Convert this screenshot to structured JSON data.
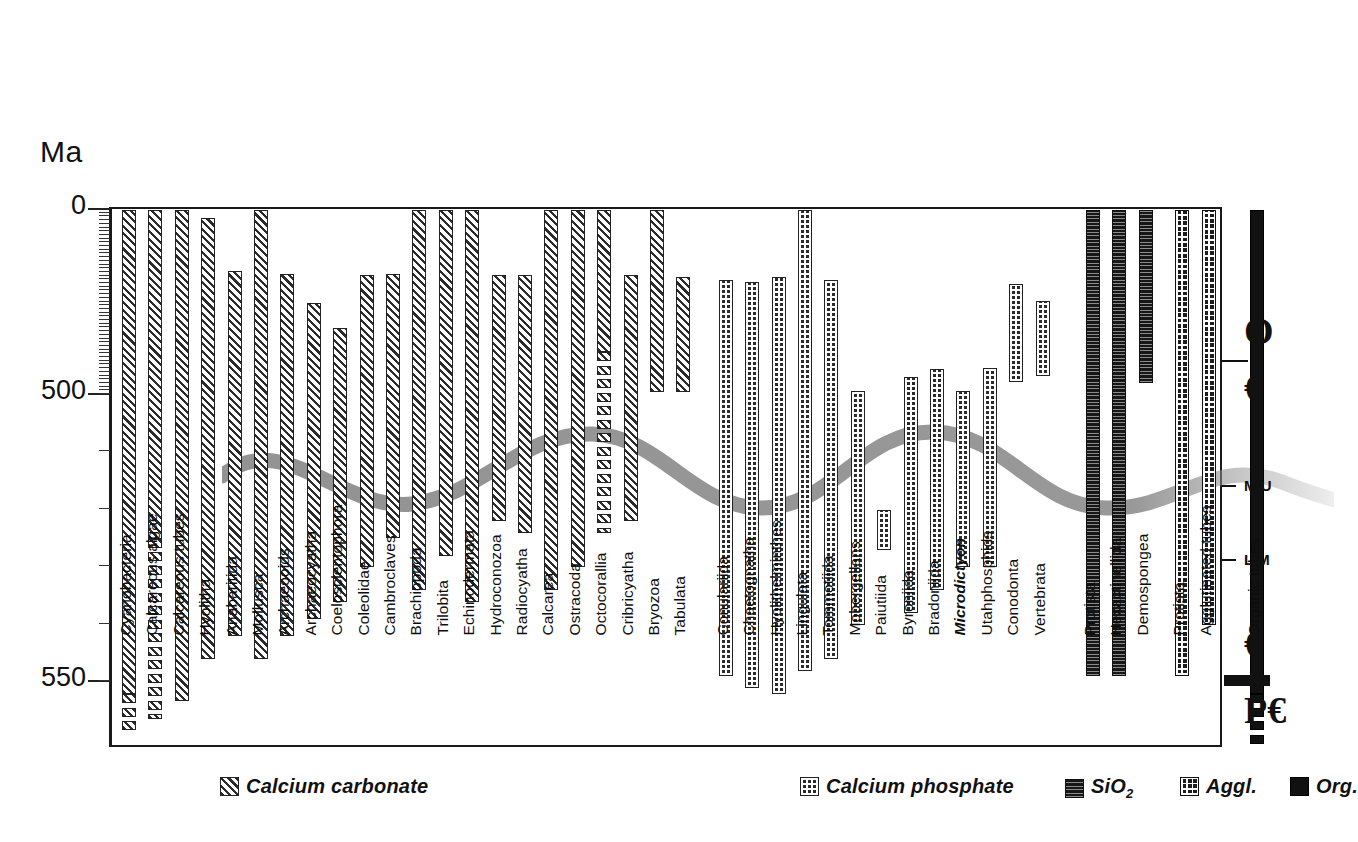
{
  "axis": {
    "unit_label": "Ma",
    "ticks": [
      {
        "label": "0",
        "value": 0
      },
      {
        "label": "500",
        "value": 500
      },
      {
        "label": "550",
        "value": 550
      }
    ]
  },
  "stratigraphy": [
    {
      "label": "O",
      "name": "ordovician"
    },
    {
      "label": "€",
      "name": "cambrian-upper"
    },
    {
      "label": "M/U",
      "name": "middle-upper-boundary"
    },
    {
      "label": "L/M",
      "name": "lower-middle-boundary"
    },
    {
      "label": "€",
      "name": "cambrian-lower"
    },
    {
      "label": "P€",
      "name": "precambrian"
    }
  ],
  "legend": [
    {
      "label": "Calcium carbonate",
      "fill": "f-carb",
      "name": "calcium-carbonate"
    },
    {
      "label": "Calcium phosphate",
      "fill": "f-phos",
      "name": "calcium-phosphate"
    },
    {
      "label": "SiO2",
      "label_html": "SiO<sub>2</sub>",
      "fill": "f-sio2",
      "name": "silica"
    },
    {
      "label": "Aggl.",
      "fill": "f-aggl",
      "name": "agglutinated"
    },
    {
      "label": "Org.",
      "fill": "f-org",
      "name": "organic"
    }
  ],
  "chart_data": {
    "type": "bar",
    "title": "",
    "orientation": "vertical-range",
    "xlabel": "",
    "ylabel": "Ma",
    "ylim": [
      0,
      560
    ],
    "y_axis_note": "Geologic time, millions of years; axis compressed above 500 Ma",
    "grid": false,
    "legend_position": "bottom",
    "categories": [
      "Cyanobacteria",
      "Calcareous algae",
      "Calcareous tubes",
      "Hyolitha",
      "Anabaritida",
      "Mollusca",
      "Archaeooids",
      "Archaeocyatha",
      "Coelosclentophora",
      "Coleolidae",
      "Cambroclaves",
      "Brachiopoda",
      "Trilobita",
      "Echinodermata",
      "Hydroconozoa",
      "Radiocyatha",
      "Calcarea",
      "Ostracoda",
      "Octocorallia",
      "Cribricyatha",
      "Bryozoa",
      "Tabulata",
      "Conulariida",
      "Chaetognatha",
      "Hyolithelminthes",
      "Lingulata",
      "Tommotiida",
      "Mobergellans",
      "Paiutiida",
      "Byroniida",
      "Bradoniida",
      "Microdictyon",
      "Utahphosphids",
      "Conodonta",
      "Vertebrata",
      "Protista",
      "Hexactinellida",
      "Demospongea",
      "Protista",
      "Agglutinated tubes",
      "Organic tubes"
    ],
    "series": [
      {
        "name": "Stratigraphic range (first appearance to top of plotted interval)",
        "unit": "Ma",
        "bars": [
          {
            "taxon": "Cyanobacteria",
            "mineralogy": "Calcium carbonate",
            "top": 0,
            "base": 558,
            "italic": false,
            "segmented_from": 552
          },
          {
            "taxon": "Calcareous algae",
            "mineralogy": "Calcium carbonate",
            "top": 0,
            "base": 556,
            "italic": false,
            "segmented_from": 525
          },
          {
            "taxon": "Calcareous tubes",
            "mineralogy": "Calcium carbonate",
            "top": 0,
            "base": 553,
            "italic": false
          },
          {
            "taxon": "Hyolitha",
            "mineralogy": "Calcium carbonate",
            "top": 22,
            "base": 546,
            "italic": false
          },
          {
            "taxon": "Anabaritida",
            "mineralogy": "Calcium carbonate",
            "top": 165,
            "base": 542,
            "italic": false
          },
          {
            "taxon": "Mollusca",
            "mineralogy": "Calcium carbonate",
            "top": 0,
            "base": 546,
            "italic": false
          },
          {
            "taxon": "Archaeooids",
            "mineralogy": "Calcium carbonate",
            "top": 172,
            "base": 542,
            "italic": false
          },
          {
            "taxon": "Archaeocyatha",
            "mineralogy": "Calcium carbonate",
            "top": 250,
            "base": 539,
            "italic": false
          },
          {
            "taxon": "Coelosclentophora",
            "mineralogy": "Calcium carbonate",
            "top": 320,
            "base": 536,
            "italic": false
          },
          {
            "taxon": "Coleolidae",
            "mineralogy": "Calcium carbonate",
            "top": 175,
            "base": 530,
            "italic": false
          },
          {
            "taxon": "Cambroclaves",
            "mineralogy": "Calcium carbonate",
            "top": 172,
            "base": 525,
            "italic": false
          },
          {
            "taxon": "Brachiopoda",
            "mineralogy": "Calcium carbonate",
            "top": 0,
            "base": 534,
            "italic": false
          },
          {
            "taxon": "Trilobita",
            "mineralogy": "Calcium carbonate",
            "top": 0,
            "base": 528,
            "italic": false
          },
          {
            "taxon": "Echinodermata",
            "mineralogy": "Calcium carbonate",
            "top": 0,
            "base": 536,
            "italic": false
          },
          {
            "taxon": "Hydroconozoa",
            "mineralogy": "Calcium carbonate",
            "top": 175,
            "base": 522,
            "italic": false
          },
          {
            "taxon": "Radiocyatha",
            "mineralogy": "Calcium carbonate",
            "top": 175,
            "base": 524,
            "italic": false
          },
          {
            "taxon": "Calcarea",
            "mineralogy": "Calcium carbonate",
            "top": 0,
            "base": 534,
            "italic": false
          },
          {
            "taxon": "Ostracoda",
            "mineralogy": "Calcium carbonate",
            "top": 0,
            "base": 530,
            "italic": false
          },
          {
            "taxon": "Octocorallia",
            "mineralogy": "Calcium carbonate",
            "top": 0,
            "base": 524,
            "italic": false,
            "segmented_from": 385
          },
          {
            "taxon": "Cribricyatha",
            "mineralogy": "Calcium carbonate",
            "top": 175,
            "base": 522,
            "italic": false
          },
          {
            "taxon": "Bryozoa",
            "mineralogy": "Calcium carbonate",
            "top": 0,
            "base": 492,
            "italic": false
          },
          {
            "taxon": "Tabulata",
            "mineralogy": "Calcium carbonate",
            "top": 180,
            "base": 492,
            "italic": false
          },
          {
            "taxon": "Conulariida",
            "mineralogy": "Calcium phosphate",
            "top": 190,
            "base": 549,
            "italic": false
          },
          {
            "taxon": "Chaetognatha",
            "mineralogy": "Calcium phosphate",
            "top": 195,
            "base": 551,
            "italic": false
          },
          {
            "taxon": "Hyolithelminthes",
            "mineralogy": "Calcium phosphate",
            "top": 180,
            "base": 552,
            "italic": false
          },
          {
            "taxon": "Lingulata",
            "mineralogy": "Calcium phosphate",
            "top": 0,
            "base": 548,
            "italic": false
          },
          {
            "taxon": "Tommotiida",
            "mineralogy": "Calcium phosphate",
            "top": 190,
            "base": 546,
            "italic": false
          },
          {
            "taxon": "Mobergellans",
            "mineralogy": "Calcium phosphate",
            "top": 490,
            "base": 540,
            "italic": false
          },
          {
            "taxon": "Paiutiida",
            "mineralogy": "Calcium phosphate",
            "top": 520,
            "base": 527,
            "italic": false
          },
          {
            "taxon": "Byroniida",
            "mineralogy": "Calcium phosphate",
            "top": 450,
            "base": 538,
            "italic": false
          },
          {
            "taxon": "Bradoniida",
            "mineralogy": "Calcium phosphate",
            "top": 430,
            "base": 534,
            "italic": false
          },
          {
            "taxon": "Microdictyon",
            "mineralogy": "Calcium phosphate",
            "top": 490,
            "base": 530,
            "italic": true
          },
          {
            "taxon": "Utahphosphids",
            "mineralogy": "Calcium phosphate",
            "top": 428,
            "base": 530,
            "italic": false
          },
          {
            "taxon": "Conodonta",
            "mineralogy": "Calcium phosphate",
            "top": 200,
            "base": 466,
            "italic": false
          },
          {
            "taxon": "Vertebrata",
            "mineralogy": "Calcium phosphate",
            "top": 245,
            "base": 450,
            "italic": false
          },
          {
            "taxon": "Protista",
            "mineralogy": "SiO2",
            "top": 0,
            "base": 549,
            "italic": false
          },
          {
            "taxon": "Hexactinellida",
            "mineralogy": "SiO2",
            "top": 0,
            "base": 549,
            "italic": false
          },
          {
            "taxon": "Demospongea",
            "mineralogy": "SiO2",
            "top": 0,
            "base": 468,
            "italic": false
          },
          {
            "taxon": "Protista",
            "mineralogy": "Agglutinated",
            "top": 0,
            "base": 549,
            "italic": false
          },
          {
            "taxon": "Agglutinated tubes",
            "mineralogy": "Agglutinated",
            "top": 0,
            "base": 540,
            "italic": false
          },
          {
            "taxon": "Organic tubes",
            "mineralogy": "Organic",
            "top": 0,
            "base": 560,
            "italic": false,
            "segmented_from": 552
          }
        ]
      }
    ]
  }
}
